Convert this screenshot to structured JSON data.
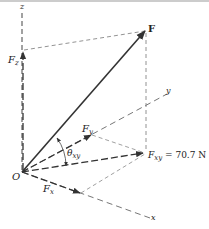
{
  "diagram": {
    "axes": {
      "x_label": "x",
      "y_label": "y",
      "z_label": "z",
      "origin_label": "O"
    },
    "force": {
      "label": "F"
    },
    "components": {
      "fz": {
        "main": "F",
        "sub": "z"
      },
      "fy": {
        "main": "F",
        "sub": "y"
      },
      "fx": {
        "main": "F",
        "sub": "x"
      },
      "fxy": {
        "main": "F",
        "sub": "xy",
        "value": " = 70.7 N"
      }
    },
    "angle": {
      "main": "θ",
      "sub": "xy"
    },
    "colors": {
      "line": "#333333",
      "dashed": "#555555",
      "border": "#bbbbbb"
    }
  }
}
